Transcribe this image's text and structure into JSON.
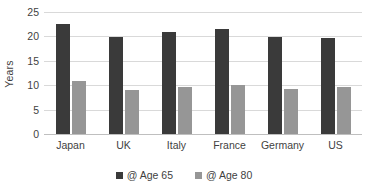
{
  "chart_data": {
    "type": "bar",
    "title": "",
    "subtitle": "",
    "xlabel": "",
    "ylabel": "Years",
    "ylim": [
      0,
      25
    ],
    "yticks": [
      0,
      5,
      10,
      15,
      20,
      25
    ],
    "ytick_labels": [
      "0",
      "5",
      "10",
      "15",
      "20",
      "25"
    ],
    "categories": [
      "Japan",
      "UK",
      "Italy",
      "France",
      "Germany",
      "US"
    ],
    "series": [
      {
        "name": "@ Age 65",
        "color": "#3a3a3a",
        "values": [
          22.5,
          19.9,
          21.0,
          21.5,
          19.9,
          19.7
        ]
      },
      {
        "name": "@ Age 80",
        "color": "#969696",
        "values": [
          10.8,
          9.1,
          9.6,
          10.1,
          9.2,
          9.6
        ]
      }
    ],
    "grid": true,
    "grid_axis": "y",
    "grid_color": "#d9d9d9",
    "legend": true,
    "legend_position": "bottom",
    "background": "#ffffff",
    "axis_text_color": "#3f3f3f"
  }
}
